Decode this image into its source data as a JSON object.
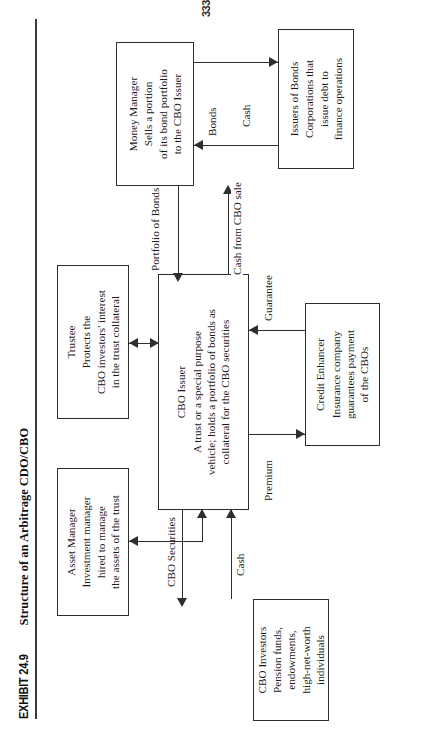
{
  "exhibit": {
    "tag": "EXHIBIT 24.9",
    "title": "Structure of an Arbitrage CDO/CBO"
  },
  "page_number": "333",
  "nodes": {
    "asset_manager": {
      "title": "Asset Manager",
      "lines": [
        "Investment manager",
        "hired to manage",
        "the assets of the trust"
      ]
    },
    "trustee": {
      "title": "Trustee",
      "lines": [
        "Protects the",
        "CBO investors' interest",
        "in the trust collateral"
      ]
    },
    "cbo_issuer": {
      "title": "CBO Issuer",
      "lines": [
        "A trust or a special purpose",
        "vehicle; holds a portfolio of bonds as",
        "collateral for the CBO securities"
      ]
    },
    "money_manager": {
      "title": "Money Manager",
      "lines": [
        "Sells a portion",
        "of its bond portfolio",
        "to the CBO Issuer"
      ]
    },
    "issuers_of_bonds": {
      "title": "Issuers of Bonds",
      "lines": [
        "Corporations that",
        "issue debt to",
        "finance operations"
      ]
    },
    "credit_enhancer": {
      "title": "Credit Enhancer",
      "lines": [
        "Insurance company",
        "guarantees payment",
        "of the CBOs"
      ]
    },
    "cbo_investors": {
      "title": "CBO Investors",
      "lines": [
        "Pension funds,",
        "endowments,",
        "high-net-worth",
        "individuals"
      ]
    }
  },
  "edges": {
    "cbo_securities": "CBO Securities",
    "cash_investors": "Cash",
    "premium": "Premium",
    "guarantee": "Guarantee",
    "portfolio_of_bonds": "Portfolio of Bonds",
    "cash_from_cbo_sale": "Cash from CBO sale",
    "bonds": "Bonds",
    "cash_issuers": "Cash"
  },
  "colors": {
    "ink": "#2e2e2e",
    "paper": "#ffffff"
  }
}
